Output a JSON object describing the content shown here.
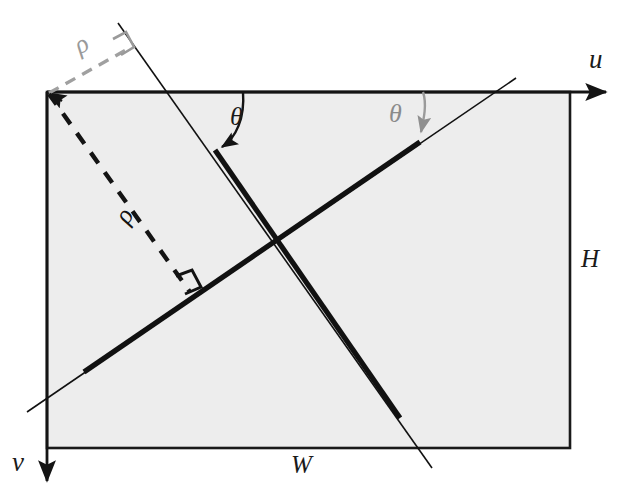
{
  "figure": {
    "type": "geometric-diagram"
  },
  "colors": {
    "plane_fill": "#ededed",
    "plane_stroke": "#1a1a1a",
    "line_stroke": "#111111",
    "accent_gray": "#8f8f8f",
    "label_color": "#1a1a1a"
  },
  "labels": {
    "axis_u": "u",
    "axis_v": "v",
    "width": "W",
    "height": "H",
    "theta_black": "θ",
    "theta_gray": "θ",
    "rho_gray": "ρ",
    "rho_black": "ρ"
  },
  "geometry": {
    "plane": {
      "x": 47,
      "y": 92,
      "w": 523,
      "h": 356
    },
    "origin": {
      "u": 47,
      "v": 92
    },
    "axis_u_arrow_end": {
      "x": 612,
      "y": 92
    },
    "axis_v_arrow_end": {
      "x": 47,
      "y": 487
    },
    "line_descending": {
      "from": {
        "x": 118,
        "y": 23
      },
      "to": {
        "x": 432,
        "y": 468
      },
      "thick_from": {
        "x": 215,
        "y": 150
      },
      "thick_to": {
        "x": 400,
        "y": 418
      }
    },
    "line_ascending": {
      "from": {
        "x": 27,
        "y": 412
      },
      "to": {
        "x": 516,
        "y": 78
      },
      "thick_from": {
        "x": 84,
        "y": 372
      },
      "thick_to": {
        "x": 420,
        "y": 142
      }
    },
    "rho_gray_segment": {
      "from": {
        "x": 47,
        "y": 92
      },
      "to": {
        "x": 124,
        "y": 50
      }
    },
    "rho_black_segment": {
      "from": {
        "x": 47,
        "y": 92
      },
      "to": {
        "x": 192,
        "y": 295
      }
    },
    "right_angle_gray": {
      "x": 124,
      "y": 50
    },
    "right_angle_black": {
      "x": 192,
      "y": 295
    },
    "theta_black_arc": {
      "start": {
        "x": 243,
        "y": 92
      },
      "end": {
        "x": 216,
        "y": 147
      }
    },
    "theta_gray_arc": {
      "start": {
        "x": 423,
        "y": 92
      },
      "end": {
        "x": 420,
        "y": 139
      }
    },
    "label_positions": {
      "axis_u": {
        "x": 589,
        "y": 60
      },
      "axis_v": {
        "x": 14,
        "y": 462
      },
      "width": {
        "x": 291,
        "y": 450
      },
      "height": {
        "x": 583,
        "y": 243
      },
      "theta_black": {
        "x": 232,
        "y": 103
      },
      "theta_gray": {
        "x": 390,
        "y": 100
      },
      "rho_gray": {
        "x": 70,
        "y": 62
      },
      "rho_black": {
        "x": 112,
        "y": 245
      }
    }
  }
}
